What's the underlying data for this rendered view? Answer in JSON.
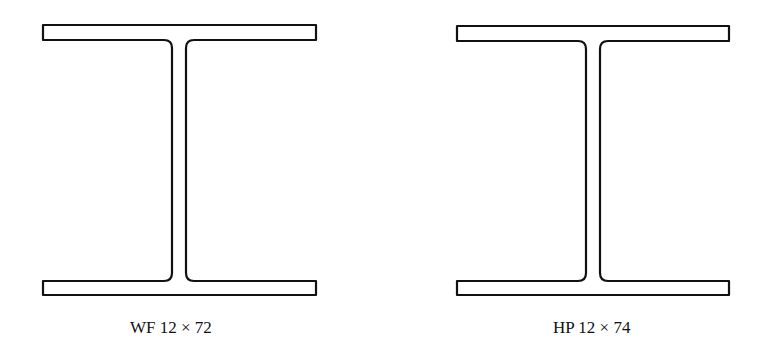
{
  "figures": [
    {
      "id": "wf",
      "label": "WF 12 × 72",
      "type": "wide-flange beam"
    },
    {
      "id": "hp",
      "label": "HP 12 × 74",
      "type": "H-pile section"
    }
  ],
  "colors": {
    "stroke": "#111111",
    "fill": "#ffffff"
  }
}
